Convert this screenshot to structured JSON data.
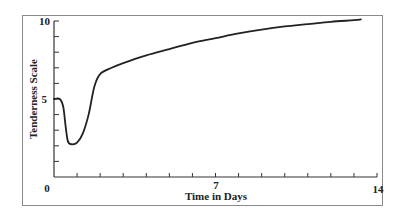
{
  "chart_data": {
    "type": "line",
    "title": "",
    "xlabel": "Time in Days",
    "ylabel": "Tenderness Scale",
    "xlim": [
      0,
      14
    ],
    "ylim": [
      0,
      10
    ],
    "x_tick_labels": [
      "0",
      "7",
      "14"
    ],
    "y_tick_labels": [
      "5",
      "10"
    ],
    "x_minor_ticks_per_major": 7,
    "y_minor_ticks_per_major": 5,
    "grid": false,
    "legend": null,
    "series": [
      {
        "name": "Tenderness",
        "x": [
          0,
          0.25,
          0.4,
          0.5,
          0.6,
          0.75,
          1.0,
          1.25,
          1.5,
          1.75,
          2.0,
          2.5,
          3,
          4,
          5,
          6,
          7,
          8,
          9,
          10,
          11,
          12,
          13,
          13.3
        ],
        "y": [
          5.0,
          5.0,
          4.5,
          3.3,
          2.3,
          2.1,
          2.2,
          2.8,
          4.0,
          5.8,
          6.6,
          7.0,
          7.3,
          7.8,
          8.2,
          8.6,
          8.9,
          9.2,
          9.45,
          9.65,
          9.8,
          9.95,
          10.05,
          10.1
        ]
      }
    ]
  },
  "labels": {
    "y_axis": "Tenderness Scale",
    "x_axis": "Time in Days",
    "x_ticks": {
      "start": "0",
      "mid": "7",
      "end": "14"
    },
    "y_ticks": {
      "mid": "5",
      "top": "10"
    }
  }
}
